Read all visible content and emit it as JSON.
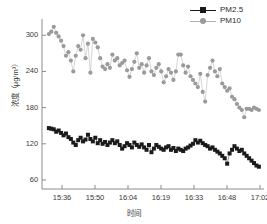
{
  "chart_data": {
    "type": "line",
    "title": "",
    "xlabel": "时间",
    "ylabel": "浓度（μg/m³）",
    "xtick_labels": [
      "15:36",
      "15:50",
      "16:04",
      "16:19",
      "16:33",
      "16:48",
      "17:02"
    ],
    "ytick_labels": [
      "60",
      "120",
      "180",
      "240",
      "300"
    ],
    "yticks": [
      60,
      120,
      180,
      240,
      300
    ],
    "ylim": [
      45,
      322
    ],
    "xlim": [
      0,
      100
    ],
    "grid": false,
    "legend_position": "top-right",
    "legend": [
      "PM2.5",
      "PM10"
    ],
    "colors": {
      "pm25": "#1a1a1a",
      "pm10": "#9a9a9a",
      "axis": "#8c8c8c",
      "text": "#3a3a3a"
    },
    "series": [
      {
        "name": "PM2.5",
        "marker": "square",
        "color": "#1a1a1a",
        "x": [
          3.1,
          4.2,
          5.3,
          6.4,
          7.5,
          8.6,
          9.7,
          10.8,
          11.9,
          13.0,
          14.1,
          15.2,
          16.3,
          17.4,
          18.5,
          19.6,
          20.7,
          21.8,
          22.9,
          24.0,
          25.1,
          26.2,
          27.3,
          28.4,
          29.5,
          30.6,
          31.7,
          32.8,
          33.9,
          35.0,
          36.1,
          37.2,
          38.3,
          39.4,
          40.5,
          41.6,
          42.7,
          43.8,
          44.9,
          46.0,
          47.1,
          48.2,
          49.3,
          50.4,
          51.5,
          52.6,
          53.7,
          54.8,
          55.9,
          57.0,
          58.1,
          59.2,
          60.3,
          61.4,
          62.5,
          63.6,
          64.7,
          65.8,
          66.9,
          68.0,
          69.1,
          70.2,
          71.3,
          72.4,
          73.5,
          74.6,
          75.7,
          76.8,
          77.9,
          79.0,
          80.1,
          81.2,
          82.3,
          83.4,
          84.5,
          85.6,
          86.7,
          87.8,
          88.9,
          90.0,
          91.1,
          92.2,
          93.3,
          94.4,
          95.5,
          96.6,
          97.7
        ],
        "values": [
          146,
          145,
          144,
          140,
          142,
          138,
          134,
          137,
          131,
          128,
          122,
          118,
          126,
          130,
          124,
          127,
          135,
          128,
          124,
          130,
          121,
          126,
          120,
          123,
          118,
          122,
          126,
          121,
          124,
          118,
          112,
          116,
          121,
          118,
          114,
          122,
          118,
          115,
          119,
          114,
          110,
          118,
          106,
          112,
          118,
          115,
          112,
          110,
          114,
          116,
          110,
          113,
          108,
          112,
          110,
          108,
          112,
          114,
          117,
          120,
          126,
          122,
          125,
          121,
          118,
          116,
          112,
          114,
          110,
          107,
          104,
          100,
          96,
          87,
          104,
          110,
          116,
          112,
          108,
          110,
          104,
          100,
          96,
          92,
          88,
          84,
          82
        ]
      },
      {
        "name": "PM10",
        "marker": "circle",
        "color": "#9a9a9a",
        "x": [
          3.1,
          4.2,
          5.3,
          6.4,
          7.5,
          8.6,
          9.7,
          10.8,
          11.9,
          13.0,
          14.1,
          15.2,
          16.3,
          17.4,
          18.5,
          19.6,
          20.7,
          21.8,
          22.9,
          24.0,
          25.1,
          26.2,
          27.3,
          28.4,
          29.5,
          30.6,
          31.7,
          32.8,
          33.9,
          35.0,
          36.1,
          37.2,
          38.3,
          39.4,
          40.5,
          41.6,
          42.7,
          43.8,
          44.9,
          46.0,
          47.1,
          48.2,
          49.3,
          50.4,
          51.5,
          52.6,
          53.7,
          54.8,
          55.9,
          57.0,
          58.1,
          59.2,
          60.3,
          61.4,
          62.5,
          63.6,
          64.7,
          65.8,
          66.9,
          68.0,
          69.1,
          70.2,
          71.3,
          72.4,
          73.5,
          74.6,
          75.7,
          76.8,
          77.9,
          79.0,
          80.1,
          81.2,
          82.3,
          83.4,
          84.5,
          85.6,
          86.7,
          87.8,
          88.9,
          90.0,
          91.1,
          92.2,
          93.3,
          94.4,
          95.5,
          96.6,
          97.7
        ],
        "values": [
          302,
          306,
          314,
          304,
          298,
          291,
          282,
          266,
          272,
          258,
          240,
          266,
          282,
          276,
          300,
          262,
          286,
          238,
          294,
          288,
          280,
          262,
          248,
          244,
          252,
          246,
          268,
          258,
          262,
          250,
          254,
          258,
          242,
          231,
          244,
          256,
          270,
          246,
          252,
          238,
          250,
          262,
          240,
          234,
          246,
          252,
          240,
          222,
          232,
          244,
          238,
          226,
          240,
          268,
          268,
          250,
          238,
          248,
          232,
          226,
          220,
          214,
          236,
          206,
          190,
          234,
          246,
          258,
          240,
          232,
          244,
          220,
          214,
          208,
          212,
          198,
          194,
          186,
          180,
          176,
          164,
          178,
          178,
          176,
          180,
          178,
          176
        ]
      }
    ]
  }
}
